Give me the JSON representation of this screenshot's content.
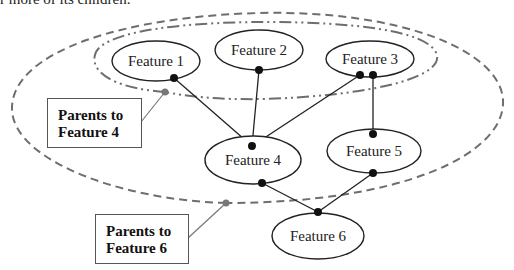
{
  "header": {
    "text": "r more of its children."
  },
  "colors": {
    "node_stroke": "#222222",
    "edge": "#222222",
    "dot": "#111111",
    "group_stroke": "#6e6e6e",
    "group_dot": "#777777"
  },
  "nodes": [
    {
      "id": "f1",
      "label": "Feature 1",
      "cx": 156,
      "cy": 61,
      "rx": 44,
      "ry": 20
    },
    {
      "id": "f2",
      "label": "Feature 2",
      "cx": 259,
      "cy": 50,
      "rx": 44,
      "ry": 20
    },
    {
      "id": "f3",
      "label": "Feature 3",
      "cx": 370,
      "cy": 59,
      "rx": 44,
      "ry": 18
    },
    {
      "id": "f4",
      "label": "Feature 4",
      "cx": 253,
      "cy": 160,
      "rx": 48,
      "ry": 24
    },
    {
      "id": "f5",
      "label": "Feature 5",
      "cx": 374,
      "cy": 151,
      "rx": 47,
      "ry": 22
    },
    {
      "id": "f6",
      "label": "Feature 6",
      "cx": 318,
      "cy": 236,
      "rx": 46,
      "ry": 23
    }
  ],
  "edges": [
    {
      "from": "f1",
      "to": "f4"
    },
    {
      "from": "f2",
      "to": "f4"
    },
    {
      "from": "f3",
      "to": "f4"
    },
    {
      "from": "f3",
      "to": "f5"
    },
    {
      "from": "f4",
      "to": "f6"
    },
    {
      "from": "f5",
      "to": "f6"
    }
  ],
  "groups": [
    {
      "id": "parents-of-f4",
      "style": "dash-dot",
      "members": [
        "f1",
        "f2",
        "f3"
      ]
    },
    {
      "id": "parents-of-f6",
      "style": "dashed",
      "members": [
        "f1",
        "f2",
        "f3",
        "f4",
        "f5"
      ]
    }
  ],
  "callouts": [
    {
      "line1": "Parents to",
      "line2": "Feature 4",
      "group": "parents-of-f4"
    },
    {
      "line1": "Parents to",
      "line2": "Feature 6",
      "group": "parents-of-f6"
    }
  ]
}
